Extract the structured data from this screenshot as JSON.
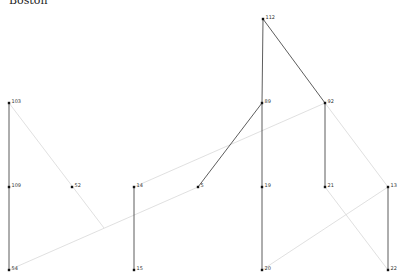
{
  "title": "Boston",
  "colors": {
    "edge_dark": "#333333",
    "edge_light": "#d8d8d8",
    "node": "#111111"
  },
  "nodes": [
    {
      "id": "112",
      "x": 263,
      "y": 19
    },
    {
      "id": "103",
      "x": 9,
      "y": 103
    },
    {
      "id": "89",
      "x": 262,
      "y": 103
    },
    {
      "id": "92",
      "x": 325,
      "y": 103
    },
    {
      "id": "109",
      "x": 9,
      "y": 187
    },
    {
      "id": "52",
      "x": 72,
      "y": 187
    },
    {
      "id": "14",
      "x": 134,
      "y": 187
    },
    {
      "id": "5",
      "x": 198,
      "y": 187
    },
    {
      "id": "19",
      "x": 262,
      "y": 187
    },
    {
      "id": "21",
      "x": 325,
      "y": 187
    },
    {
      "id": "13",
      "x": 388,
      "y": 187
    },
    {
      "id": "54",
      "x": 9,
      "y": 270
    },
    {
      "id": "15",
      "x": 134,
      "y": 270
    },
    {
      "id": "20",
      "x": 262,
      "y": 270
    },
    {
      "id": "22",
      "x": 388,
      "y": 270
    }
  ],
  "edges": [
    {
      "from": "112",
      "to": "89",
      "style": "dark"
    },
    {
      "from": "112",
      "to": "92",
      "style": "dark"
    },
    {
      "from": "103",
      "to": "109",
      "style": "dark"
    },
    {
      "from": "109",
      "to": "54",
      "style": "dark"
    },
    {
      "from": "89",
      "to": "5",
      "style": "dark"
    },
    {
      "from": "89",
      "to": "19",
      "style": "dark"
    },
    {
      "from": "19",
      "to": "20",
      "style": "dark"
    },
    {
      "from": "92",
      "to": "21",
      "style": "dark"
    },
    {
      "from": "14",
      "to": "15",
      "style": "dark"
    },
    {
      "from": "13",
      "to": "22",
      "style": "dark"
    },
    {
      "from": "54",
      "to": "5",
      "style": "light"
    },
    {
      "from": "14",
      "to": "92",
      "style": "light"
    },
    {
      "from": "92",
      "to": "13",
      "style": "light"
    },
    {
      "from": "21",
      "to": "22",
      "style": "light"
    },
    {
      "from": "20",
      "to": "13",
      "style": "light"
    },
    {
      "from": "103",
      "to": "@104,228",
      "style": "light"
    }
  ]
}
